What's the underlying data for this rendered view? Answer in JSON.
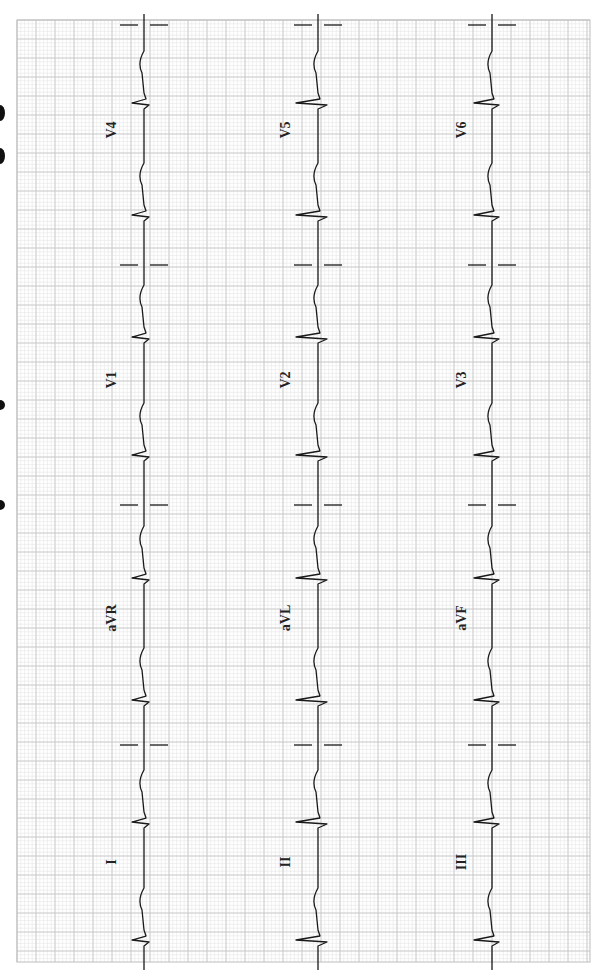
{
  "ecg": {
    "orientation": "rotated-90",
    "grid": {
      "x": 17,
      "y": 20,
      "width": 573,
      "height": 942,
      "minor_spacing": 3.8,
      "major_spacing": 19,
      "minor_color": "#e6e6e6",
      "major_color": "#c8c8c8",
      "border_color": "#bdbdbd"
    },
    "trace_color": "#1a1a1a",
    "rows": [
      {
        "baseline_x": 144,
        "leads": [
          {
            "label": "V4",
            "label_y": 130
          },
          {
            "label": "V1",
            "label_y": 380
          },
          {
            "label": "aVR",
            "label_y": 618
          },
          {
            "label": "I",
            "label_y": 862
          }
        ],
        "beats_y": [
          103,
          215,
          337,
          455,
          578,
          700,
          822,
          940
        ],
        "qrs_amp": 12
      },
      {
        "baseline_x": 318,
        "leads": [
          {
            "label": "V5",
            "label_y": 130
          },
          {
            "label": "V2",
            "label_y": 380
          },
          {
            "label": "aVL",
            "label_y": 618
          },
          {
            "label": "II",
            "label_y": 862
          }
        ],
        "beats_y": [
          103,
          215,
          337,
          455,
          578,
          700,
          822,
          940
        ],
        "qrs_amp": 22
      },
      {
        "baseline_x": 492,
        "leads": [
          {
            "label": "V6",
            "label_y": 130
          },
          {
            "label": "V3",
            "label_y": 380
          },
          {
            "label": "aVF",
            "label_y": 618
          },
          {
            "label": "III",
            "label_y": 862
          }
        ],
        "beats_y": [
          103,
          215,
          337,
          455,
          578,
          700,
          822,
          940
        ],
        "qrs_amp": 18
      }
    ],
    "separators_y": [
      25,
      265,
      505,
      745
    ],
    "label_x": [
      112,
      286,
      462
    ]
  },
  "edge_marks": [
    {
      "y": 105,
      "h": 16
    },
    {
      "y": 148,
      "h": 16
    },
    {
      "y": 400,
      "h": 10
    },
    {
      "y": 500,
      "h": 10
    }
  ]
}
